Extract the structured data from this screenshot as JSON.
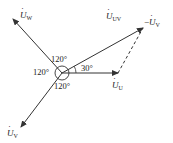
{
  "diagram": {
    "type": "phasor-diagram",
    "colors": {
      "line": "#333333",
      "background": "#ffffff"
    },
    "origin": {
      "x": 62,
      "y": 73,
      "circle_radius": 7
    },
    "phasors": [
      {
        "id": "U",
        "label_main": "U",
        "label_sub": "U",
        "end": {
          "x": 118,
          "y": 73
        },
        "style": "solid"
      },
      {
        "id": "UV",
        "label_main": "U",
        "label_sub": "UV",
        "end": {
          "x": 143,
          "y": 28
        },
        "style": "solid"
      },
      {
        "id": "W",
        "label_main": "U",
        "label_sub": "W",
        "end": {
          "x": 13,
          "y": 19
        },
        "style": "solid"
      },
      {
        "id": "V",
        "label_main": "U",
        "label_sub": "V",
        "end": {
          "x": 21,
          "y": 127
        },
        "style": "solid"
      },
      {
        "id": "negV",
        "label_prefix": "−",
        "label_main": "U",
        "label_sub": "V",
        "start": {
          "x": 118,
          "y": 73
        },
        "end": {
          "x": 143,
          "y": 28
        },
        "style": "dashed"
      }
    ],
    "angles": [
      {
        "id": "top",
        "text": "120°"
      },
      {
        "id": "left",
        "text": "120°"
      },
      {
        "id": "bottom",
        "text": "120°"
      },
      {
        "id": "uv",
        "text": "30°"
      }
    ]
  }
}
